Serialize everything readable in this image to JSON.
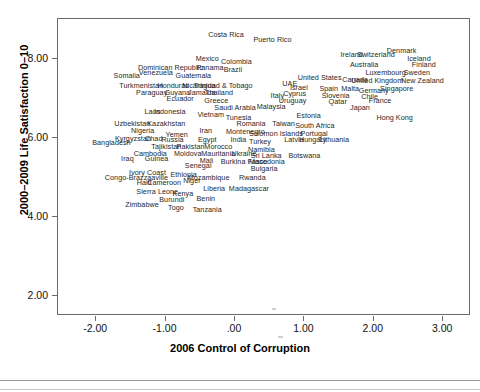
{
  "chart_data": {
    "type": "scatter",
    "title": "",
    "xlabel": "2006 Control of Corruption",
    "ylabel": "2000–2009 Life Satisfaction 0–10",
    "xlim": [
      -2.55,
      3.4
    ],
    "ylim": [
      1.5,
      9.0
    ],
    "xticks": [
      "-2.00",
      "-1.00",
      ".00",
      "1.00",
      "2.00",
      "3.00"
    ],
    "xtick_values": [
      -2.0,
      -1.0,
      0.0,
      1.0,
      2.0,
      3.0
    ],
    "yticks": [
      "2.00",
      "4.00",
      "6.00",
      "8.00"
    ],
    "ytick_values": [
      2.0,
      4.0,
      6.0,
      8.0
    ],
    "grid": false,
    "legend": null,
    "marker": "text-label",
    "points": [
      {
        "label": "Costa Rica",
        "x": -0.13,
        "y": 8.6
      },
      {
        "label": "Puerto Rico",
        "x": 0.54,
        "y": 8.47
      },
      {
        "label": "Denmark",
        "x": 2.4,
        "y": 8.18
      },
      {
        "label": "Ireland",
        "x": 1.68,
        "y": 8.08
      },
      {
        "label": "Switzerland",
        "x": 2.03,
        "y": 8.08
      },
      {
        "label": "Iceland",
        "x": 2.65,
        "y": 8.0
      },
      {
        "label": "Mexico",
        "x": -0.4,
        "y": 8.0
      },
      {
        "label": "Colombia",
        "x": 0.02,
        "y": 7.92
      },
      {
        "label": "Australia",
        "x": 1.86,
        "y": 7.84
      },
      {
        "label": "Finland",
        "x": 2.72,
        "y": 7.84
      },
      {
        "label": "Dominican Republic",
        "x": -0.93,
        "y": 7.76
      },
      {
        "label": "Panama",
        "x": -0.36,
        "y": 7.76
      },
      {
        "label": "Brazil",
        "x": -0.03,
        "y": 7.7
      },
      {
        "label": "Venezuela",
        "x": -1.14,
        "y": 7.64
      },
      {
        "label": "Luxembourg",
        "x": 2.17,
        "y": 7.64
      },
      {
        "label": "Sweden",
        "x": 2.62,
        "y": 7.64
      },
      {
        "label": "Somalia",
        "x": -1.56,
        "y": 7.55
      },
      {
        "label": "Guatemala",
        "x": -0.6,
        "y": 7.55
      },
      {
        "label": "United States",
        "x": 1.22,
        "y": 7.52
      },
      {
        "label": "Canada",
        "x": 1.73,
        "y": 7.47
      },
      {
        "label": "United Kingdom",
        "x": 2.05,
        "y": 7.43
      },
      {
        "label": "New Zealand",
        "x": 2.7,
        "y": 7.43
      },
      {
        "label": "UAE",
        "x": 0.79,
        "y": 7.35
      },
      {
        "label": "Trinidad & Tobago",
        "x": -0.17,
        "y": 7.32
      },
      {
        "label": "Turkmenistan",
        "x": -1.35,
        "y": 7.3
      },
      {
        "label": "Honduras",
        "x": -0.89,
        "y": 7.3
      },
      {
        "label": "Nicaragua",
        "x": -0.52,
        "y": 7.3
      },
      {
        "label": "Israel",
        "x": 0.92,
        "y": 7.26
      },
      {
        "label": "Spain",
        "x": 1.35,
        "y": 7.22
      },
      {
        "label": "Malta",
        "x": 1.66,
        "y": 7.22
      },
      {
        "label": "Germany",
        "x": 2.0,
        "y": 7.18
      },
      {
        "label": "Singapore",
        "x": 2.33,
        "y": 7.22
      },
      {
        "label": "Paraguay",
        "x": -1.2,
        "y": 7.14
      },
      {
        "label": "Guyana",
        "x": -0.83,
        "y": 7.14
      },
      {
        "label": "Jamaica",
        "x": -0.48,
        "y": 7.14
      },
      {
        "label": "Thailand",
        "x": -0.23,
        "y": 7.14
      },
      {
        "label": "Cyprus",
        "x": 0.86,
        "y": 7.1
      },
      {
        "label": "Italy",
        "x": 0.61,
        "y": 7.06
      },
      {
        "label": "Slovenia",
        "x": 1.45,
        "y": 7.06
      },
      {
        "label": "Chile",
        "x": 1.94,
        "y": 7.02
      },
      {
        "label": "Ecuador",
        "x": -0.79,
        "y": 6.98
      },
      {
        "label": "Greece",
        "x": -0.27,
        "y": 6.94
      },
      {
        "label": "Uruguay",
        "x": 0.83,
        "y": 6.94
      },
      {
        "label": "Qatar",
        "x": 1.48,
        "y": 6.9
      },
      {
        "label": "France",
        "x": 2.09,
        "y": 6.94
      },
      {
        "label": "Saudi Arabia",
        "x": 0.0,
        "y": 6.74
      },
      {
        "label": "Malaysia",
        "x": 0.52,
        "y": 6.78
      },
      {
        "label": "Japan",
        "x": 1.8,
        "y": 6.74
      },
      {
        "label": "Laos",
        "x": -1.19,
        "y": 6.66
      },
      {
        "label": "Indonesia",
        "x": -0.94,
        "y": 6.66
      },
      {
        "label": "Vietnam",
        "x": -0.35,
        "y": 6.58
      },
      {
        "label": "Tunesia",
        "x": 0.05,
        "y": 6.5
      },
      {
        "label": "Estonia",
        "x": 1.06,
        "y": 6.54
      },
      {
        "label": "Hong Kong",
        "x": 2.3,
        "y": 6.5
      },
      {
        "label": "Uzbekistan",
        "x": -1.48,
        "y": 6.34
      },
      {
        "label": "Kazakhstan",
        "x": -0.99,
        "y": 6.34
      },
      {
        "label": "Romania",
        "x": 0.23,
        "y": 6.34
      },
      {
        "label": "Taiwan",
        "x": 0.7,
        "y": 6.34
      },
      {
        "label": "South Africa",
        "x": 1.15,
        "y": 6.3
      },
      {
        "label": "Nigeria",
        "x": -1.33,
        "y": 6.18
      },
      {
        "label": "Iran",
        "x": -0.42,
        "y": 6.18
      },
      {
        "label": "Montenegro",
        "x": 0.15,
        "y": 6.14
      },
      {
        "label": "Solomon Islands",
        "x": 0.59,
        "y": 6.1
      },
      {
        "label": "Portugal",
        "x": 1.14,
        "y": 6.1
      },
      {
        "label": "Yemen",
        "x": -0.84,
        "y": 6.06
      },
      {
        "label": "Kyrgyzstan",
        "x": -1.47,
        "y": 5.98
      },
      {
        "label": "Chad",
        "x": -1.17,
        "y": 5.98
      },
      {
        "label": "Russia",
        "x": -0.9,
        "y": 5.94
      },
      {
        "label": "Egypt",
        "x": -0.4,
        "y": 5.94
      },
      {
        "label": "India",
        "x": 0.05,
        "y": 5.94
      },
      {
        "label": "Turkey",
        "x": 0.36,
        "y": 5.9
      },
      {
        "label": "Latvia",
        "x": 0.85,
        "y": 5.94
      },
      {
        "label": "Hungary",
        "x": 1.12,
        "y": 5.94
      },
      {
        "label": "Lithuania",
        "x": 1.43,
        "y": 5.94
      },
      {
        "label": "Bangladesh",
        "x": -1.78,
        "y": 5.86
      },
      {
        "label": "Tajikistan",
        "x": -0.99,
        "y": 5.78
      },
      {
        "label": "Pakistan",
        "x": -0.64,
        "y": 5.78
      },
      {
        "label": "Morocco",
        "x": -0.24,
        "y": 5.78
      },
      {
        "label": "Namibia",
        "x": 0.38,
        "y": 5.7
      },
      {
        "label": "Cambodia",
        "x": -1.22,
        "y": 5.58
      },
      {
        "label": "Moldova",
        "x": -0.68,
        "y": 5.58
      },
      {
        "label": "Mauritania",
        "x": -0.24,
        "y": 5.58
      },
      {
        "label": "Ukraine",
        "x": 0.13,
        "y": 5.58
      },
      {
        "label": "Sri Lanka",
        "x": 0.45,
        "y": 5.54
      },
      {
        "label": "Botswana",
        "x": 1.0,
        "y": 5.54
      },
      {
        "label": "Iraq",
        "x": -1.55,
        "y": 5.46
      },
      {
        "label": "Guinea",
        "x": -1.13,
        "y": 5.46
      },
      {
        "label": "Mali",
        "x": -0.41,
        "y": 5.42
      },
      {
        "label": "Burkina Fasso",
        "x": 0.13,
        "y": 5.38
      },
      {
        "label": "Macedonia",
        "x": 0.46,
        "y": 5.38
      },
      {
        "label": "Senegal",
        "x": -0.53,
        "y": 5.3
      },
      {
        "label": "Bulgaria",
        "x": 0.42,
        "y": 5.22
      },
      {
        "label": "Ivory Coast",
        "x": -1.26,
        "y": 5.1
      },
      {
        "label": "Ethiopia",
        "x": -0.74,
        "y": 5.06
      },
      {
        "label": "Congo-Brazzaaville",
        "x": -1.42,
        "y": 4.98
      },
      {
        "label": "Mozambique",
        "x": -0.38,
        "y": 4.98
      },
      {
        "label": "Rwanda",
        "x": 0.25,
        "y": 4.98
      },
      {
        "label": "Niger",
        "x": -0.62,
        "y": 4.9
      },
      {
        "label": "Haiti",
        "x": -1.31,
        "y": 4.86
      },
      {
        "label": "Cameroon",
        "x": -1.02,
        "y": 4.86
      },
      {
        "label": "Liberia",
        "x": -0.3,
        "y": 4.7
      },
      {
        "label": "Madagascar",
        "x": 0.2,
        "y": 4.7
      },
      {
        "label": "Sierra Leone",
        "x": -1.12,
        "y": 4.62
      },
      {
        "label": "Kenya",
        "x": -0.75,
        "y": 4.58
      },
      {
        "label": "Benin",
        "x": -0.42,
        "y": 4.46
      },
      {
        "label": "Burundi",
        "x": -0.91,
        "y": 4.42
      },
      {
        "label": "Zimbabwe",
        "x": -1.34,
        "y": 4.3
      },
      {
        "label": "Togo",
        "x": -0.85,
        "y": 4.22
      },
      {
        "label": "Tanzania",
        "x": -0.4,
        "y": 4.18
      }
    ]
  },
  "axes": {
    "x_title": "2006 Control of Corruption",
    "y_title": "2000–2009 Life Satisfaction 0–10"
  }
}
